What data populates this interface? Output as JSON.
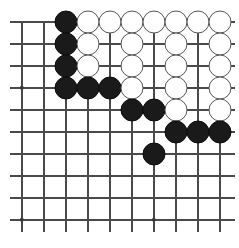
{
  "diagram": {
    "board": {
      "cell_size": 22,
      "origin_x": 22,
      "origin_y": 22,
      "columns": 10,
      "rows": 10,
      "line_color": "#4a4a4a",
      "background_color": "#ffffff",
      "stone_radius": 11.5,
      "left_overhang": 12,
      "right_overhang": 15,
      "bottom_overhang": 12,
      "top_overhang": 0
    },
    "star_points": [
      {
        "col": 1,
        "row": 4
      },
      {
        "col": 1,
        "row": 10
      },
      {
        "col": 7,
        "row": 10
      }
    ],
    "stones": [
      {
        "color": "black",
        "col": 3,
        "row": 1
      },
      {
        "color": "white",
        "col": 4,
        "row": 1
      },
      {
        "color": "white",
        "col": 5,
        "row": 1
      },
      {
        "color": "white",
        "col": 6,
        "row": 1
      },
      {
        "color": "white",
        "col": 7,
        "row": 1
      },
      {
        "color": "white",
        "col": 8,
        "row": 1
      },
      {
        "color": "white",
        "col": 9,
        "row": 1
      },
      {
        "color": "white",
        "col": 10,
        "row": 1
      },
      {
        "color": "black",
        "col": 3,
        "row": 2
      },
      {
        "color": "white",
        "col": 4,
        "row": 2
      },
      {
        "color": "white",
        "col": 6,
        "row": 2
      },
      {
        "color": "white",
        "col": 8,
        "row": 2
      },
      {
        "color": "white",
        "col": 10,
        "row": 2
      },
      {
        "color": "black",
        "col": 3,
        "row": 3
      },
      {
        "color": "white",
        "col": 4,
        "row": 3
      },
      {
        "color": "white",
        "col": 6,
        "row": 3
      },
      {
        "color": "white",
        "col": 8,
        "row": 3
      },
      {
        "color": "white",
        "col": 10,
        "row": 3
      },
      {
        "color": "black",
        "col": 3,
        "row": 4
      },
      {
        "color": "black",
        "col": 4,
        "row": 4
      },
      {
        "color": "black",
        "col": 5,
        "row": 4
      },
      {
        "color": "white",
        "col": 6,
        "row": 4
      },
      {
        "color": "white",
        "col": 8,
        "row": 4
      },
      {
        "color": "white",
        "col": 10,
        "row": 4
      },
      {
        "color": "black",
        "col": 6,
        "row": 5
      },
      {
        "color": "black",
        "col": 7,
        "row": 5
      },
      {
        "color": "white",
        "col": 8,
        "row": 5
      },
      {
        "color": "white",
        "col": 10,
        "row": 5
      },
      {
        "color": "black",
        "col": 8,
        "row": 6
      },
      {
        "color": "black",
        "col": 9,
        "row": 6
      },
      {
        "color": "black",
        "col": 10,
        "row": 6
      },
      {
        "color": "black",
        "col": 7,
        "row": 7
      }
    ]
  }
}
